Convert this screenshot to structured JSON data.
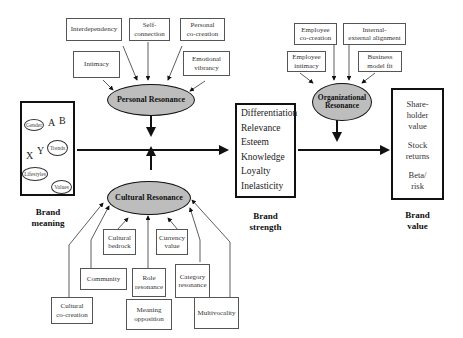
{
  "diagram": {
    "personal_resonance": {
      "label": "Personal Resonance",
      "inputs": [
        "Interdependency",
        "Self-\nconnection",
        "Personal\nco-creation",
        "Intimacy",
        "Emotional\nvibrancy"
      ]
    },
    "cultural_resonance": {
      "label": "Cultural Resonance",
      "inputs": [
        "Cultural\nbedrock",
        "Currency\nvalue",
        "Community",
        "Role\nresonance",
        "Category\nresonance",
        "Cultural\nco-creation",
        "Meaning\nopposition",
        "Multivocality"
      ]
    },
    "organizational_resonance": {
      "label": "Organizational\nResonance",
      "inputs": [
        "Employee\nco-creation",
        "Internal-\nexternal alignment",
        "Employee\nintimacy",
        "Business\nmodel fit"
      ]
    },
    "brand_meaning": {
      "caption": "Brand\nmeaning",
      "nodes": [
        "Gender",
        "Trends",
        "Lifestyles",
        "Values"
      ],
      "letters": [
        "A",
        "B",
        "X",
        "Y"
      ]
    },
    "brand_strength": {
      "caption": "Brand\nstrength",
      "items": [
        "Differentiation",
        "Relevance",
        "Esteem",
        "Knowledge",
        "Loyalty",
        "Inelasticity"
      ]
    },
    "brand_value": {
      "caption": "Brand\nvalue",
      "items": [
        "Share-\nholder\nvalue",
        "Stock\nreturns",
        "Beta/\nrisk"
      ]
    }
  }
}
